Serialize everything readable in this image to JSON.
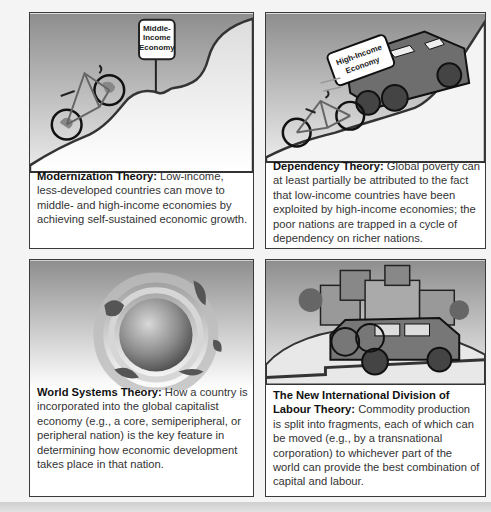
{
  "panels": [
    {
      "title": "Modernization Theory:",
      "body": " Low-income, less-developed countries can move to middle- and high-income economies by achieving self-sustained economic growth.",
      "illustration": "bicycle-climbing-hill",
      "sign_text": [
        "Middle-",
        "Income",
        "Economy"
      ]
    },
    {
      "title": "Dependency Theory:",
      "body": " Global poverty can at least partially be attributed to the fact that low-income countries have been exploited by high-income economies; the poor nations are trapped in a cycle of dependency on richer nations.",
      "illustration": "truck-blocking-bicycle",
      "sign_text": [
        "High-Income",
        "Economy"
      ]
    },
    {
      "title": "World Systems Theory:",
      "body": " How a country is incorporated into the global capitalist economy (e.g., a core, semiperipheral, or peripheral nation) is the key feature in determining how economic development takes place in that nation.",
      "illustration": "globe-with-orbiting-continents"
    },
    {
      "title": "The New International Division of Labour Theory:",
      "body": " Commodity production is split into fragments, each of which can be moved (e.g., by a transnational corporation) to whichever part of the world can provide the best combination of capital and labour.",
      "illustration": "vehicle-carrying-city-and-bicycle"
    }
  ],
  "colors": {
    "panel_gradient_top": "#8f8f8f",
    "panel_gradient_bottom": "#ffffff",
    "border": "#3a3a3a",
    "text": "#333333"
  }
}
